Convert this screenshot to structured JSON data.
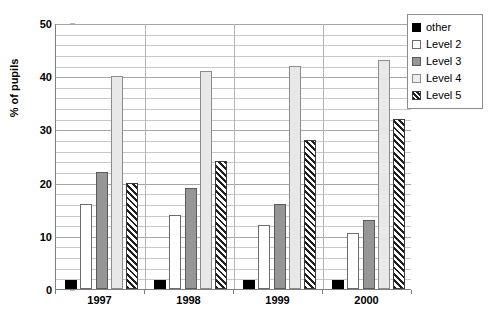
{
  "chart_data": {
    "type": "bar",
    "title": "",
    "subtitle": "",
    "xlabel": "",
    "ylabel": "% of pupils",
    "categories": [
      "1997",
      "1998",
      "1999",
      "2000"
    ],
    "series": [
      {
        "name": "other",
        "values": [
          1.7,
          1.7,
          1.7,
          1.7
        ]
      },
      {
        "name": "Level 2",
        "values": [
          16,
          14,
          12,
          10.5
        ]
      },
      {
        "name": "Level 3",
        "values": [
          22,
          19,
          16,
          13
        ]
      },
      {
        "name": "Level 4",
        "values": [
          40,
          41,
          42,
          43
        ]
      },
      {
        "name": "Level 5",
        "values": [
          20,
          24,
          28,
          32
        ]
      }
    ],
    "ylim": [
      0,
      50
    ],
    "y_major_ticks": [
      0,
      10,
      20,
      30,
      40,
      50
    ],
    "y_tick_labels": [
      "0",
      "10",
      "20",
      "30",
      "40",
      "50"
    ],
    "y_minor_step": 2,
    "grid": true,
    "grid_axis": "y",
    "legend_position": "right-top",
    "legend": [
      "other",
      "Level 2",
      "Level 3",
      "Level 4",
      "Level 5"
    ],
    "series_colors": [
      "#000000",
      "#ffffff",
      "#969696",
      "#e8e8e8",
      "hatched"
    ]
  },
  "legend": {
    "items": [
      {
        "label": "other",
        "swatch": "black-square-swatch"
      },
      {
        "label": "Level 2",
        "swatch": "white-square-swatch"
      },
      {
        "label": "Level 3",
        "swatch": "gray-square-swatch"
      },
      {
        "label": "Level 4",
        "swatch": "light-gray-square-swatch"
      },
      {
        "label": "Level 5",
        "swatch": "hatched-square-swatch"
      }
    ]
  },
  "axes": {
    "y_title": "% of pupils",
    "y_labels": [
      "50",
      "40",
      "30",
      "20",
      "10",
      "0"
    ],
    "x_labels": [
      "1997",
      "1998",
      "1999",
      "2000"
    ]
  },
  "colors": {
    "other": "#000000",
    "level2": "#ffffff",
    "level3": "#969696",
    "level4": "#e8e8e8",
    "level5_hatch": "#1e1e1e",
    "gridline": "#c8c8c8",
    "axis": "#808080",
    "background": "#ffffff"
  }
}
